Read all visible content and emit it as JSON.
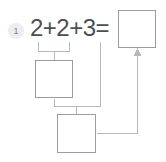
{
  "problem": {
    "number": "1",
    "equation": "2+2+3=",
    "operands": [
      "2",
      "2",
      "3"
    ],
    "operators": [
      "+",
      "+"
    ],
    "equals_sign": "="
  },
  "boxes": {
    "answer": {
      "name": "answer-box",
      "value": "",
      "filled": false
    },
    "work_step_1": {
      "name": "work-box-1",
      "value": "",
      "filled": false
    },
    "work_step_2": {
      "name": "work-box-2",
      "value": "",
      "filled": false
    }
  },
  "connectors": {
    "bracket_1_label": "2 + 2 group bracket",
    "bracket_2_label": "partial sum + 3 group bracket",
    "arrow_label": "result arrow to answer box"
  },
  "colors": {
    "background": "#ffffff",
    "stroke": "#9a9da0",
    "text": "#4b4f52",
    "badge_background": "#eceded",
    "badge_text": "#7e8385",
    "connector": "#b6b9bb"
  }
}
